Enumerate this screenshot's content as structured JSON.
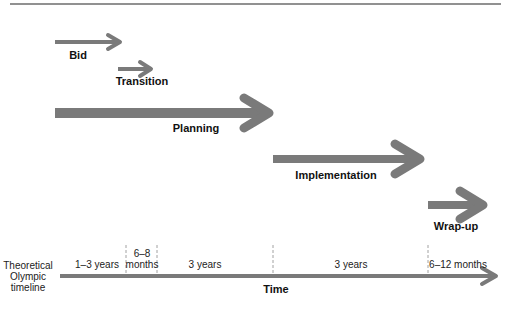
{
  "diagram": {
    "colors": {
      "arrow": "#7a7a7a",
      "rule": "#6d6d6d",
      "text": "#111111",
      "dashed": "#8a8a8a"
    },
    "phases": [
      {
        "label": "Bid",
        "x1": 55,
        "x2": 121,
        "y": 42,
        "thick": 4,
        "label_x": 78,
        "label_y": 50
      },
      {
        "label": "Transition",
        "x1": 118,
        "x2": 152,
        "y": 69,
        "thick": 4,
        "label_x": 141,
        "label_y": 76
      },
      {
        "label": "Planning",
        "x1": 55,
        "x2": 272,
        "y": 110,
        "thick": 9,
        "label_x": 196,
        "label_y": 122
      },
      {
        "label": "Implementation",
        "x1": 273,
        "x2": 422,
        "y": 158,
        "thick": 7,
        "label_x": 335,
        "label_y": 170
      },
      {
        "label": "Wrap-up",
        "x1": 428,
        "x2": 485,
        "y": 205,
        "thick": 7,
        "label_x": 455,
        "label_y": 220
      }
    ],
    "timeline": {
      "row_label": [
        "Theoretical",
        "Olympic",
        "timeline"
      ],
      "axis_label": "Time",
      "segments": [
        {
          "label": "1–3 years",
          "center_x": 97
        },
        {
          "label": "6–8\nmonths",
          "line1": "6–8",
          "line2": "months",
          "center_x": 142
        },
        {
          "label": "3 years",
          "center_x": 205
        },
        {
          "label": "3 years",
          "center_x": 351
        },
        {
          "label": "6–12 months",
          "center_x": 457
        }
      ],
      "dividers_x": [
        126,
        157,
        273,
        428
      ]
    }
  }
}
